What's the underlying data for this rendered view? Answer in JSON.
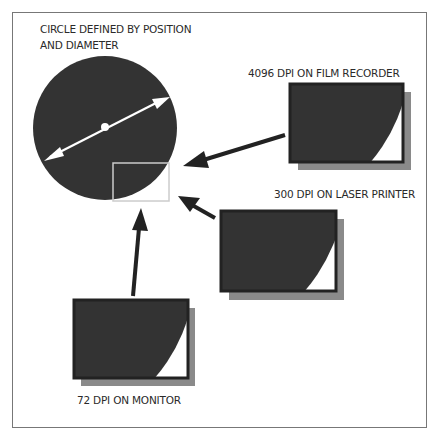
{
  "title_lines": [
    "CIRCLE DEFINED BY POSITION",
    "AND DIAMETER"
  ],
  "outputs": [
    {
      "label": "4096 DPI ON FILM RECORDER",
      "dpi": 4096,
      "device": "film recorder"
    },
    {
      "label": "300 DPI ON LASER PRINTER",
      "dpi": 300,
      "device": "laser printer"
    },
    {
      "label": "72 DPI ON MONITOR",
      "dpi": 72,
      "device": "monitor"
    }
  ],
  "colors": {
    "fill": "#333333",
    "shadow": "#8a8a8a",
    "frame": "#777777",
    "zoom_box": "#cccccc"
  }
}
